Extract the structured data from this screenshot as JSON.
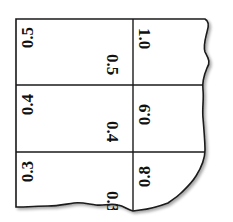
{
  "diagram": {
    "grid": {
      "columns": 2,
      "rows": 3,
      "line_color": "#1a1a1a",
      "background": "#ffffff"
    },
    "cells": [
      {
        "row": 0,
        "col": 0,
        "left_value": "0.5",
        "right_value": "0.5"
      },
      {
        "row": 0,
        "col": 1,
        "left_value": "1.0"
      },
      {
        "row": 1,
        "col": 0,
        "left_value": "0.4",
        "right_value": "0.4"
      },
      {
        "row": 1,
        "col": 1,
        "left_value": "0.9"
      },
      {
        "row": 2,
        "col": 0,
        "left_value": "0.3",
        "right_value": "0.3"
      },
      {
        "row": 2,
        "col": 1,
        "left_value": "0.8"
      }
    ],
    "labels": {
      "r0_left": "0.5",
      "r0_mid": "0.5",
      "r0_right": "1.0",
      "r1_left": "0.4",
      "r1_mid": "0.4",
      "r1_right": "0.9",
      "r2_left": "0.3",
      "r2_mid": "0.3",
      "r2_right": "0.8"
    }
  }
}
